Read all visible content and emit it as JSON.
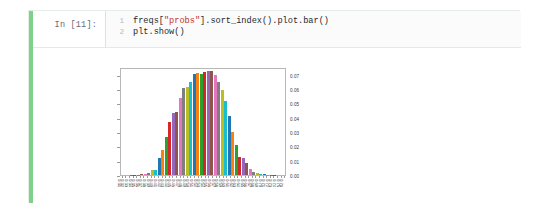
{
  "notebook": {
    "input_prompt": "In [11]:",
    "output_prompt": "",
    "code_lines": [
      {
        "number": "1",
        "segments": [
          {
            "text": "freqs[",
            "kind": "plain"
          },
          {
            "text": "\"probs\"",
            "kind": "string"
          },
          {
            "text": "].sort_index().plot.bar()",
            "kind": "plain"
          }
        ]
      },
      {
        "number": "2",
        "segments": [
          {
            "text": "plt.show()",
            "kind": "plain"
          }
        ]
      }
    ]
  },
  "colors": {
    "cell_border": "#e4eee6",
    "select_bar": "#7fd18a",
    "code_background": "#fbfbfb",
    "prompt_text": "#6a6a7a",
    "string_token": "#c0392b",
    "axes_border": "#b7b7b7",
    "tick_text": "#3b3b3b",
    "cycle": [
      "#1f77b4",
      "#ff7f0e",
      "#2ca02c",
      "#d62728",
      "#9467bd",
      "#8c564b",
      "#e377c2",
      "#7f7f7f",
      "#bcbd22",
      "#17becf"
    ]
  },
  "chart_data": {
    "type": "bar",
    "title": "",
    "xlabel": "",
    "ylabel": "",
    "grid": false,
    "legend": false,
    "ylim": [
      0,
      0.0755
    ],
    "ytick_values": [
      0.0,
      0.01,
      0.02,
      0.03,
      0.04,
      0.05,
      0.06,
      0.07
    ],
    "ytick_labels": [
      "0.00",
      "0.01",
      "0.02",
      "0.03",
      "0.04",
      "0.05",
      "0.06",
      "0.07"
    ],
    "categories": [
      "0.31",
      "0.32",
      "0.33",
      "0.34",
      "0.35",
      "0.36",
      "0.37",
      "0.38",
      "0.39",
      "0.40",
      "0.41",
      "0.42",
      "0.43",
      "0.44",
      "0.45",
      "0.46",
      "0.47",
      "0.48",
      "0.49",
      "0.50",
      "0.51",
      "0.52",
      "0.53",
      "0.54",
      "0.55",
      "0.56",
      "0.57",
      "0.58",
      "0.59",
      "0.60",
      "0.61",
      "0.62",
      "0.63",
      "0.64",
      "0.65",
      "0.66",
      "0.67",
      "0.68",
      "0.69",
      "0.70",
      "0.71",
      "0.72",
      "0.73",
      "0.74",
      "0.75",
      "0.76"
    ],
    "values": [
      0.0,
      0.0,
      0.0001,
      0.0001,
      0.0002,
      0.0004,
      0.0008,
      0.0015,
      0.0035,
      0.0036,
      0.0118,
      0.0175,
      0.0268,
      0.038,
      0.0444,
      0.0449,
      0.0548,
      0.062,
      0.0627,
      0.0663,
      0.0721,
      0.0724,
      0.0717,
      0.0734,
      0.074,
      0.0742,
      0.0714,
      0.0664,
      0.0607,
      0.0527,
      0.0417,
      0.0307,
      0.0211,
      0.0129,
      0.0119,
      0.0083,
      0.0044,
      0.0025,
      0.0012,
      0.0007,
      0.0004,
      0.0002,
      0.0001,
      0.0001,
      0.0,
      0.0
    ]
  }
}
